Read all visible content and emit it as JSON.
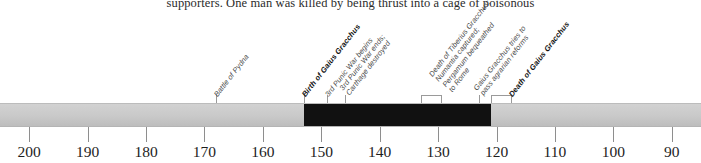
{
  "page": {
    "body_text_fragment": "supporters. One man was killed by being thrust into a cage of poisonous"
  },
  "timeline": {
    "axis": {
      "start_year_bc": 205,
      "end_year_bc": 85,
      "direction": "descending",
      "tick_years_bc": [
        200,
        190,
        180,
        170,
        160,
        150,
        140,
        130,
        120,
        110,
        100,
        90
      ],
      "tick_labels": [
        "200",
        "190",
        "180",
        "170",
        "160",
        "150",
        "140",
        "130",
        "120",
        "110",
        "100",
        "90"
      ]
    },
    "bar": {
      "base_color": "#c9c9c9",
      "highlight_color": "#111111",
      "highlight_start_year_bc": 153,
      "highlight_end_year_bc": 121,
      "highlight_label": "lifetime-of-gaius-gracchus"
    },
    "events": [
      {
        "id": "battle-of-pydna",
        "lines": [
          "Battle of Pydna"
        ],
        "year_bc": 168,
        "bold": false,
        "connector": "line"
      },
      {
        "id": "birth-of-gaius-gracchus",
        "lines": [
          "Birth of Gaius Gracchus"
        ],
        "year_bc": 153,
        "bold": true,
        "connector": "line"
      },
      {
        "id": "third-punic-war-begins",
        "lines": [
          "3rd Punic War begins"
        ],
        "year_bc": 149,
        "bold": false,
        "connector": "line"
      },
      {
        "id": "third-punic-war-ends",
        "lines": [
          "3rd Punic War ends;",
          "Carthage destroyed"
        ],
        "year_bc": 146,
        "bold": false,
        "connector": "line"
      },
      {
        "id": "death-of-tiberius-gracchus",
        "lines": [
          "Death of Tiberius Gracchus;",
          "Numantia captured;",
          "Pergamum bequeathed",
          "to Rome"
        ],
        "year_bc": 133,
        "bold": false,
        "connector": "bracket"
      },
      {
        "id": "gaius-gracchus-agrarian-reforms",
        "lines": [
          "Gaius Gracchus tries to",
          "pass agrarian reforms"
        ],
        "year_bc": 123,
        "bold": false,
        "connector": "line"
      },
      {
        "id": "death-of-gaius-gracchus",
        "lines": [
          "Death of Gaius Gracchus"
        ],
        "year_bc": 121,
        "bold": true,
        "connector": "bracket"
      }
    ]
  }
}
